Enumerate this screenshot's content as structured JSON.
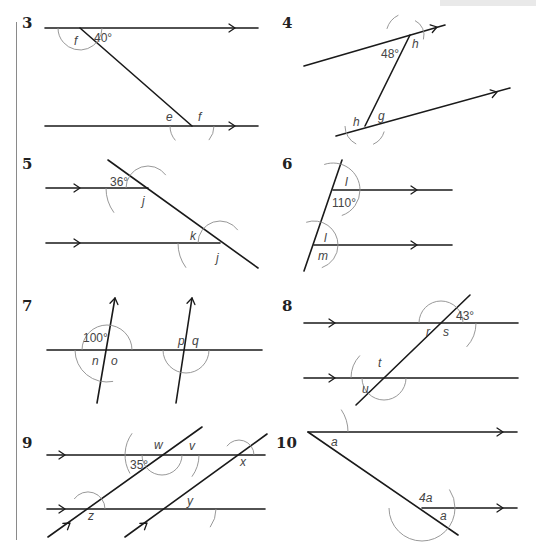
{
  "colors": {
    "line": "#1a1a1a",
    "arc": "#8c8c8c",
    "label": "#444444",
    "rule": "#8a8a8a"
  },
  "questions": [
    {
      "number": "3",
      "numPos": [
        22,
        22
      ],
      "lines": [
        [
          45,
          28,
          258,
          28
        ],
        [
          45,
          126,
          258,
          126
        ],
        [
          80,
          28,
          192,
          126
        ]
      ],
      "arrows": [
        [
          235,
          28,
          0
        ]
      ],
      "arrows2": [
        [
          235,
          126,
          0
        ]
      ],
      "arcs": [
        [
          80,
          28,
          22,
          180,
          221
        ],
        [
          80,
          28,
          22,
          221,
          360
        ],
        [
          192,
          126,
          22,
          180,
          221
        ],
        [
          192,
          126,
          22,
          320,
          360
        ]
      ],
      "labels": [
        {
          "t": "f",
          "x": 74,
          "y": 45,
          "i": true
        },
        {
          "t": "40°",
          "x": 94,
          "y": 42,
          "i": false
        },
        {
          "t": "e",
          "x": 166,
          "y": 121,
          "i": true
        },
        {
          "t": "f",
          "x": 198,
          "y": 121,
          "i": true
        }
      ]
    },
    {
      "number": "4",
      "numPos": [
        282,
        22
      ],
      "lines": [
        [
          304,
          66,
          445,
          25
        ],
        [
          336,
          136,
          510,
          88
        ],
        [
          410,
          35,
          365,
          126
        ]
      ],
      "arrows": [
        [
          437,
          27,
          -16
        ]
      ],
      "arrows2": [
        [
          497,
          92,
          -16
        ]
      ],
      "arcs": [
        [
          408,
          35,
          22,
          116,
          164
        ],
        [
          408,
          35,
          16,
          -16,
          64
        ],
        [
          365,
          126,
          20,
          180,
          244
        ],
        [
          365,
          126,
          20,
          294,
          344
        ]
      ],
      "labels": [
        {
          "t": "48°",
          "x": 381,
          "y": 58,
          "i": false
        },
        {
          "t": "h",
          "x": 412,
          "y": 48,
          "i": true
        },
        {
          "t": "h",
          "x": 353,
          "y": 126,
          "i": true
        },
        {
          "t": "g",
          "x": 378,
          "y": 120,
          "i": true
        }
      ]
    },
    {
      "number": "5",
      "numPos": [
        22,
        163
      ],
      "lines": [
        [
          46,
          188,
          148,
          188
        ],
        [
          46,
          243,
          220,
          243
        ],
        [
          108,
          160,
          258,
          268
        ]
      ],
      "arrows": [
        [
          80,
          188,
          0
        ]
      ],
      "arrows2": [
        [
          80,
          243,
          0
        ]
      ],
      "arcs": [
        [
          148,
          188,
          42,
          180,
          216
        ],
        [
          148,
          188,
          22,
          36,
          180
        ],
        [
          220,
          243,
          42,
          180,
          216
        ],
        [
          220,
          243,
          22,
          36,
          180
        ]
      ],
      "labels": [
        {
          "t": "36°",
          "x": 110,
          "y": 186,
          "i": false
        },
        {
          "t": "j",
          "x": 142,
          "y": 205,
          "i": true
        },
        {
          "t": "k",
          "x": 190,
          "y": 240,
          "i": true
        },
        {
          "t": "j",
          "x": 216,
          "y": 262,
          "i": true
        }
      ]
    },
    {
      "number": "6",
      "numPos": [
        282,
        163
      ],
      "lines": [
        [
          333,
          190,
          452,
          190
        ],
        [
          314,
          245,
          452,
          245
        ],
        [
          342,
          160,
          304,
          271
        ]
      ],
      "arrows": [
        [
          417,
          190,
          0
        ]
      ],
      "arrows2": [
        [
          417,
          245,
          0
        ]
      ],
      "arcs": [
        [
          333,
          190,
          27,
          -71,
          0
        ],
        [
          333,
          190,
          27,
          0,
          109
        ],
        [
          314,
          245,
          24,
          -71,
          0
        ],
        [
          314,
          245,
          24,
          0,
          109
        ]
      ],
      "labels": [
        {
          "t": "l",
          "x": 345,
          "y": 186,
          "i": true
        },
        {
          "t": "110°",
          "x": 332,
          "y": 207,
          "i": false
        },
        {
          "t": "l",
          "x": 324,
          "y": 242,
          "i": true
        },
        {
          "t": "m",
          "x": 318,
          "y": 260,
          "i": true
        }
      ]
    },
    {
      "number": "7",
      "numPos": [
        22,
        305
      ],
      "lines": [
        [
          47,
          350,
          262,
          350
        ],
        [
          115,
          298,
          97,
          403
        ],
        [
          192,
          298,
          176,
          403
        ]
      ],
      "arrows": [
        [
          115,
          298,
          -80
        ]
      ],
      "arrows2": [
        [
          192,
          298,
          -80
        ]
      ],
      "arcs": [
        [
          107,
          350,
          32,
          180,
          281
        ],
        [
          107,
          350,
          25,
          0,
          180
        ],
        [
          186,
          350,
          23,
          180,
          360
        ]
      ],
      "labels": [
        {
          "t": "100°",
          "x": 83,
          "y": 342,
          "i": false
        },
        {
          "t": "n",
          "x": 92,
          "y": 365,
          "i": true
        },
        {
          "t": "o",
          "x": 111,
          "y": 365,
          "i": true
        },
        {
          "t": "p",
          "x": 178,
          "y": 345,
          "i": true
        },
        {
          "t": "q",
          "x": 192,
          "y": 345,
          "i": true
        }
      ]
    },
    {
      "number": "8",
      "numPos": [
        282,
        305
      ],
      "lines": [
        [
          304,
          323,
          518,
          323
        ],
        [
          304,
          378,
          518,
          378
        ],
        [
          470,
          295,
          356,
          405
        ]
      ],
      "arrows": [
        [
          335,
          323,
          0
        ]
      ],
      "arrows2": [
        [
          335,
          378,
          0
        ]
      ],
      "arcs": [
        [
          441,
          323,
          35,
          -43,
          0
        ],
        [
          441,
          323,
          22,
          0,
          180
        ],
        [
          384,
          378,
          22,
          180,
          360
        ],
        [
          384,
          378,
          33,
          137,
          180
        ]
      ],
      "labels": [
        {
          "t": "43°",
          "x": 456,
          "y": 320,
          "i": false
        },
        {
          "t": "r",
          "x": 426,
          "y": 336,
          "i": true
        },
        {
          "t": "s",
          "x": 443,
          "y": 336,
          "i": true
        },
        {
          "t": "t",
          "x": 378,
          "y": 367,
          "i": true
        },
        {
          "t": "u",
          "x": 362,
          "y": 393,
          "i": true
        }
      ]
    },
    {
      "number": "9",
      "numPos": [
        22,
        442
      ],
      "lines": [
        [
          47,
          455,
          265,
          455
        ],
        [
          47,
          509,
          265,
          509
        ],
        [
          48,
          537,
          202,
          427
        ],
        [
          125,
          537,
          267,
          434
        ]
      ],
      "arrows": [
        [
          65,
          455,
          0
        ],
        [
          65,
          509,
          0
        ]
      ],
      "arrows2": [
        [
          70,
          523,
          -36
        ],
        [
          147,
          523,
          -36
        ]
      ],
      "arcs": [
        [
          162,
          455,
          20,
          180,
          360
        ],
        [
          162,
          455,
          37,
          -36,
          0
        ],
        [
          162,
          455,
          37,
          144,
          210
        ],
        [
          239,
          455,
          15,
          0,
          144
        ],
        [
          185,
          509,
          31,
          -36,
          0
        ],
        [
          88,
          509,
          17,
          0,
          144
        ]
      ],
      "labels": [
        {
          "t": "w",
          "x": 154,
          "y": 449,
          "i": true
        },
        {
          "t": "v",
          "x": 189,
          "y": 450,
          "i": true
        },
        {
          "t": "35°",
          "x": 130,
          "y": 469,
          "i": false
        },
        {
          "t": "x",
          "x": 240,
          "y": 466,
          "i": true
        },
        {
          "t": "y",
          "x": 187,
          "y": 505,
          "i": true
        },
        {
          "t": "z",
          "x": 88,
          "y": 520,
          "i": true
        }
      ]
    },
    {
      "number": "10",
      "numPos": [
        276,
        442
      ],
      "lines": [
        [
          308,
          432,
          517,
          432
        ],
        [
          422,
          508,
          517,
          508
        ],
        [
          308,
          432,
          458,
          535
        ]
      ],
      "arrows": [
        [
          503,
          432,
          0
        ]
      ],
      "arrows2": [
        [
          503,
          508,
          0
        ]
      ],
      "arcs": [
        [
          308,
          432,
          40,
          0,
          34
        ],
        [
          422,
          508,
          33,
          180,
          360
        ],
        [
          422,
          508,
          33,
          0,
          34
        ]
      ],
      "labels": [
        {
          "t": "a",
          "x": 331,
          "y": 446,
          "i": true
        },
        {
          "t": "4a",
          "x": 419,
          "y": 502,
          "i": true
        },
        {
          "t": "a",
          "x": 440,
          "y": 520,
          "i": true
        }
      ]
    }
  ]
}
